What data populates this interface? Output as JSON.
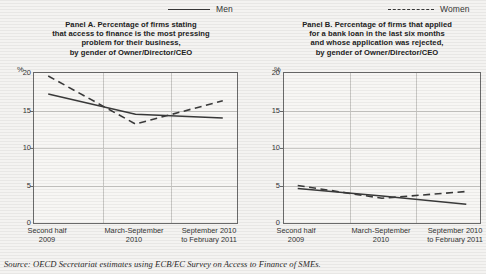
{
  "legend": {
    "items": [
      {
        "label": "Men",
        "style": "solid",
        "icon": "solid-line-icon"
      },
      {
        "label": "Women",
        "style": "dashed",
        "icon": "dashed-line-icon"
      }
    ]
  },
  "panels": [
    {
      "id": "panel-a",
      "title": "Panel A. Percentage of firms stating\nthat access to finance is the most pressing\nproblem for their business,\nby gender of Owner/Director/CEO",
      "title_lines": [
        "Panel A. Percentage of firms stating",
        "that access to finance is the most pressing",
        "problem for their business,",
        "by gender of Owner/Director/CEO"
      ],
      "unit": "%",
      "ylabels": [
        "20",
        "15",
        "10",
        "5",
        "0"
      ]
    },
    {
      "id": "panel-b",
      "title_lines": [
        "Panel B. Percentage of firms that applied",
        "for a bank loan in the last six months",
        "and whose application was rejected,",
        "by gender of Owner/Director/CEO"
      ],
      "unit": "%",
      "ylabels": [
        "20",
        "15",
        "10",
        "5",
        "0"
      ]
    }
  ],
  "xcategories": [
    {
      "line1": "Second half",
      "line2": "2009"
    },
    {
      "line1": "March-September",
      "line2": "2010"
    },
    {
      "line1": "September 2010",
      "line2": "to February 2011"
    }
  ],
  "source": {
    "lead": "Source:",
    "text": "OECD Secretariat estimates using ECB/EC Survey on Access to Finance of SMEs."
  },
  "colors": {
    "line": "#3a3a3a",
    "grid": "#c9c8c5",
    "frame": "#6a6a6a",
    "background": "#f4f3f1",
    "plot_background": "#f7f6f4",
    "text": "#2b2b2b"
  },
  "chart_data": [
    {
      "type": "line",
      "title": "Panel A. Percentage of firms stating that access to finance is the most pressing problem for their business, by gender of Owner/Director/CEO",
      "xlabel": "",
      "ylabel": "%",
      "ylim": [
        0,
        20
      ],
      "yticks": [
        0,
        5,
        10,
        15,
        20
      ],
      "grid": true,
      "legend_position": "top",
      "categories": [
        "Second half 2009",
        "March-September 2010",
        "September 2010 to February 2011"
      ],
      "x_fractions": [
        0.07,
        0.5,
        0.93
      ],
      "series": [
        {
          "name": "Men",
          "style": "solid",
          "values": [
            17.2,
            14.5,
            14.0
          ]
        },
        {
          "name": "Women",
          "style": "dashed",
          "values": [
            19.6,
            13.2,
            16.3
          ]
        }
      ]
    },
    {
      "type": "line",
      "title": "Panel B. Percentage of firms that applied for a bank loan in the last six months and whose application was rejected, by gender of Owner/Director/CEO",
      "xlabel": "",
      "ylabel": "%",
      "ylim": [
        0,
        20
      ],
      "yticks": [
        0,
        5,
        10,
        15,
        20
      ],
      "grid": true,
      "legend_position": "top",
      "categories": [
        "Second half 2009",
        "March-September 2010",
        "September 2010 to February 2011"
      ],
      "x_fractions": [
        0.07,
        0.5,
        0.93
      ],
      "series": [
        {
          "name": "Men",
          "style": "solid",
          "values": [
            4.6,
            3.6,
            2.5
          ]
        },
        {
          "name": "Women",
          "style": "dashed",
          "values": [
            5.0,
            3.3,
            4.2
          ]
        }
      ]
    }
  ]
}
